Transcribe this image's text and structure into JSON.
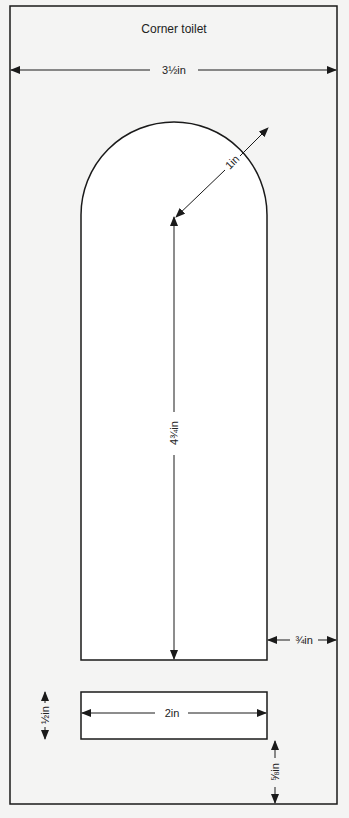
{
  "diagram": {
    "title": "Corner toilet",
    "colors": {
      "background": "#f4f4f3",
      "shape_fill": "#ffffff",
      "stroke": "#1a1a1a"
    },
    "dimensions": {
      "overall_width": "3½in",
      "arch_radius": "1in",
      "body_height": "4¾in",
      "side_gap": "¾in",
      "slot_width": "2in",
      "slot_height": "½in",
      "bottom_gap": "⅝in"
    },
    "shapes": [
      {
        "name": "outer-frame",
        "type": "rect"
      },
      {
        "name": "arched-body",
        "type": "round-top-rect"
      },
      {
        "name": "slot",
        "type": "rect"
      }
    ]
  }
}
